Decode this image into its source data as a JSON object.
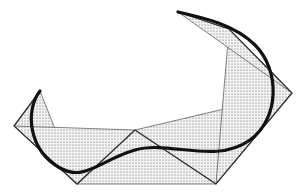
{
  "diagram": {
    "colors": {
      "background": "#ffffff",
      "curve": "#111111",
      "polygon": "#333333",
      "stipple": "#555555"
    },
    "control_points": [
      [
        40,
        91
      ],
      [
        14,
        126
      ],
      [
        77,
        184
      ],
      [
        135,
        130
      ],
      [
        216,
        184
      ],
      [
        292,
        93
      ],
      [
        229,
        29
      ],
      [
        178,
        12
      ]
    ],
    "triangles": [
      [
        [
          40,
          91
        ],
        [
          14,
          126
        ],
        [
          77,
          184
        ]
      ],
      [
        [
          14,
          126
        ],
        [
          77,
          184
        ],
        [
          135,
          130
        ]
      ],
      [
        [
          77,
          184
        ],
        [
          135,
          130
        ],
        [
          216,
          184
        ]
      ],
      [
        [
          135,
          130
        ],
        [
          216,
          184
        ],
        [
          292,
          93
        ]
      ],
      [
        [
          216,
          184
        ],
        [
          292,
          93
        ],
        [
          229,
          29
        ]
      ],
      [
        [
          292,
          93
        ],
        [
          229,
          29
        ],
        [
          178,
          12
        ]
      ]
    ],
    "curve_path": "M40,91 C25,110 28,150 60,168 C85,182 100,160 135,150 C170,140 215,165 250,140 C280,118 280,70 255,45 C235,25 205,18 178,12"
  }
}
